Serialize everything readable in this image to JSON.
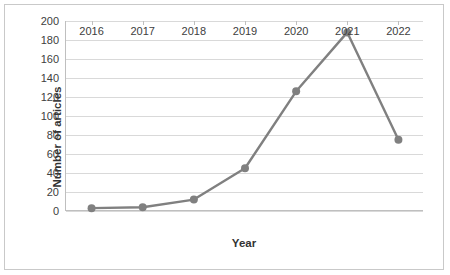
{
  "chart_data": {
    "type": "line",
    "title": "",
    "xlabel": "Year",
    "ylabel": "Number of articles",
    "categories": [
      "2016",
      "2017",
      "2018",
      "2019",
      "2020",
      "2021",
      "2022"
    ],
    "values": [
      3,
      4,
      12,
      45,
      126,
      188,
      75
    ],
    "series": [
      {
        "name": "Number of articles",
        "values": [
          3,
          4,
          12,
          45,
          126,
          188,
          75
        ],
        "color": "#808080",
        "marker": "circle"
      }
    ],
    "ylim": [
      0,
      200
    ],
    "yticks": [
      0,
      20,
      40,
      60,
      80,
      100,
      120,
      140,
      160,
      180,
      200
    ],
    "ytick_labels": [
      "0",
      "20",
      "40",
      "60",
      "80",
      "100",
      "120",
      "140",
      "160",
      "180",
      "200"
    ],
    "grid": "horizontal",
    "legend": "none",
    "frame": true
  }
}
